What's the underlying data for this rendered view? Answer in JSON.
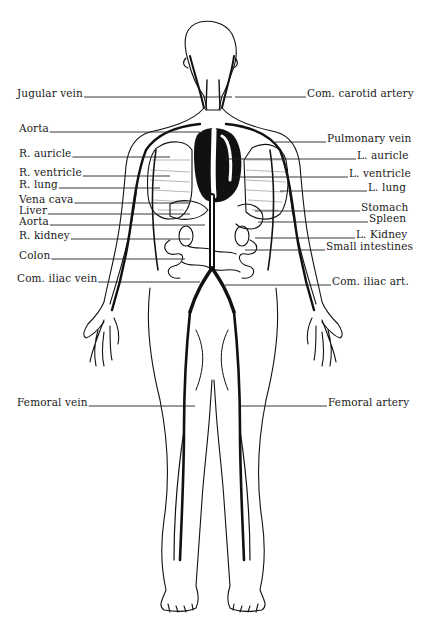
{
  "figure": {
    "colors": {
      "ink": "#111111",
      "background": "#ffffff",
      "label": "#1a1a1a"
    },
    "labels_left": [
      {
        "text": "Jugular vein",
        "x": 17,
        "y": 94,
        "line_to": 232
      },
      {
        "text": "Aorta",
        "x": 19,
        "y": 129,
        "line_to": 200
      },
      {
        "text": "R. auricle",
        "x": 19,
        "y": 154,
        "line_to": 170
      },
      {
        "text": "R. ventricle",
        "x": 19,
        "y": 173,
        "line_to": 170
      },
      {
        "text": "R. lung",
        "x": 19,
        "y": 185,
        "line_to": 160
      },
      {
        "text": "Vena cava",
        "x": 19,
        "y": 200,
        "line_to": 190
      },
      {
        "text": "Liver",
        "x": 19,
        "y": 211,
        "line_to": 190
      },
      {
        "text": "Aorta",
        "x": 19,
        "y": 222,
        "line_to": 205
      },
      {
        "text": "R. kidney",
        "x": 19,
        "y": 236,
        "line_to": 190
      },
      {
        "text": "Colon",
        "x": 19,
        "y": 256,
        "line_to": 185
      },
      {
        "text": "Com. iliac vein",
        "x": 17,
        "y": 279,
        "line_to": 200
      },
      {
        "text": "Femoral vein",
        "x": 17,
        "y": 403,
        "line_to": 195
      }
    ],
    "labels_right": [
      {
        "text": "Com. carotid artery",
        "x": 307,
        "y": 94,
        "line_from": 235
      },
      {
        "text": "Pulmonary vein",
        "x": 327,
        "y": 139,
        "line_from": 275
      },
      {
        "text": "L. auricle",
        "x": 357,
        "y": 156,
        "line_from": 225
      },
      {
        "text": "L. ventricle",
        "x": 349,
        "y": 174,
        "line_from": 232
      },
      {
        "text": "L. lung",
        "x": 368,
        "y": 188,
        "line_from": 280
      },
      {
        "text": "Stomach",
        "x": 361,
        "y": 208,
        "line_from": 255
      },
      {
        "text": "Spleen",
        "x": 369,
        "y": 219,
        "line_from": 258
      },
      {
        "text": "L. Kidney",
        "x": 356,
        "y": 235,
        "line_from": 255
      },
      {
        "text": "Small intestines",
        "x": 326,
        "y": 247,
        "line_from": 245
      },
      {
        "text": "Com. iliac art.",
        "x": 332,
        "y": 282,
        "line_from": 225
      },
      {
        "text": "Femoral artery",
        "x": 328,
        "y": 403,
        "line_from": 240
      }
    ]
  }
}
